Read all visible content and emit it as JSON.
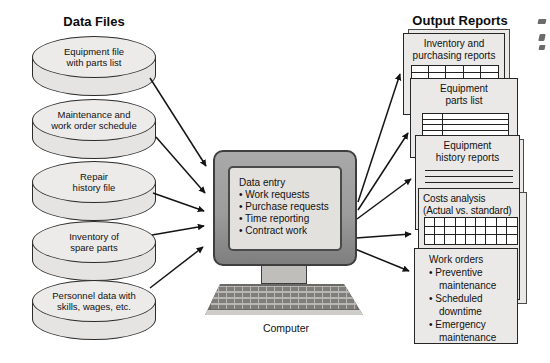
{
  "figure": {
    "type": "system-flow-diagram"
  },
  "left_section": {
    "title": "Data Files",
    "files": [
      {
        "lines": [
          "Equipment file",
          "with parts list"
        ]
      },
      {
        "lines": [
          "Maintenance and",
          "work order schedule"
        ]
      },
      {
        "lines": [
          "Repair",
          "history file"
        ]
      },
      {
        "lines": [
          "Inventory of",
          "spare parts"
        ]
      },
      {
        "lines": [
          "Personnel data with",
          "skills, wages, etc."
        ]
      }
    ]
  },
  "computer": {
    "caption": "Computer",
    "screen_heading": "Data entry",
    "screen_items": [
      "Work requests",
      "Purchase requests",
      "Time reporting",
      "Contract work"
    ]
  },
  "right_section": {
    "title": "Output Reports",
    "reports": [
      {
        "lines": [
          "Inventory and",
          "purchasing reports"
        ],
        "visual": "table-grid-5x2"
      },
      {
        "lines": [
          "Equipment",
          "parts list"
        ],
        "visual": "form-table-2x4"
      },
      {
        "lines": [
          "Equipment",
          "history reports"
        ],
        "visual": "ruled-lines-3"
      },
      {
        "lines": [
          "Costs analysis",
          "(Actual vs. standard)"
        ],
        "visual": "table-grid-9x3"
      },
      {
        "heading": "Work orders",
        "items": [
          "Preventive maintenance",
          "Scheduled downtime",
          "Emergency maintenance"
        ],
        "visual": "bulleted-list"
      }
    ]
  },
  "colors": {
    "background": "#ffffff",
    "shape_fill": "#eae8e6",
    "shape_outline": "#2b2b2b",
    "monitor_frame": "#9a9a9a",
    "screen_fill": "#e3e1de",
    "keyboard_body": "#b9b7b4",
    "key_color": "#828078",
    "arrow": "#141414",
    "text": "#111111"
  }
}
